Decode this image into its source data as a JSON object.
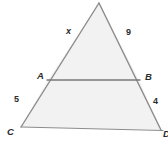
{
  "figure": {
    "type": "geometry-diagram",
    "shape": "triangle-with-midsegment",
    "colors": {
      "fill": "#f2f2f2",
      "stroke": "#8c8c8c",
      "segment_stroke": "#7a7a7a",
      "label": "#2b2b2b",
      "background": "#ffffff"
    },
    "vertices": [
      {
        "name": "apex",
        "label": "",
        "x": 99,
        "y": 3
      },
      {
        "name": "A",
        "label": "A",
        "x": 48,
        "y": 80
      },
      {
        "name": "B",
        "label": "B",
        "x": 139,
        "y": 80
      },
      {
        "name": "C",
        "label": "C",
        "x": 21,
        "y": 127
      },
      {
        "name": "D",
        "label": "D",
        "x": 161,
        "y": 130
      }
    ],
    "vertex_labels": [
      {
        "id": "label-A",
        "text": "A",
        "left": 37,
        "top": 71
      },
      {
        "id": "label-B",
        "text": "B",
        "left": 145,
        "top": 72
      },
      {
        "id": "label-C",
        "text": "C",
        "left": 7,
        "top": 127
      },
      {
        "id": "label-D",
        "text": "D",
        "left": 163,
        "top": 129
      }
    ],
    "side_labels": [
      {
        "id": "label-x",
        "text": "x",
        "left": 66,
        "top": 27,
        "style": "var"
      },
      {
        "id": "label-9",
        "text": "9",
        "left": 126,
        "top": 28,
        "style": "num"
      },
      {
        "id": "label-5",
        "text": "5",
        "left": 14,
        "top": 95,
        "style": "num"
      },
      {
        "id": "label-4",
        "text": "4",
        "left": 153,
        "top": 97,
        "style": "num"
      }
    ],
    "segments": [
      {
        "name": "left-side-apex-to-C",
        "from": "apex",
        "to": "C",
        "measures": [
          "x",
          "5"
        ]
      },
      {
        "name": "right-side-apex-to-D",
        "from": "apex",
        "to": "D",
        "measures": [
          "9",
          "4"
        ]
      },
      {
        "name": "segment-AB",
        "from": "A",
        "to": "B"
      },
      {
        "name": "base-CD",
        "from": "C",
        "to": "D"
      }
    ]
  }
}
